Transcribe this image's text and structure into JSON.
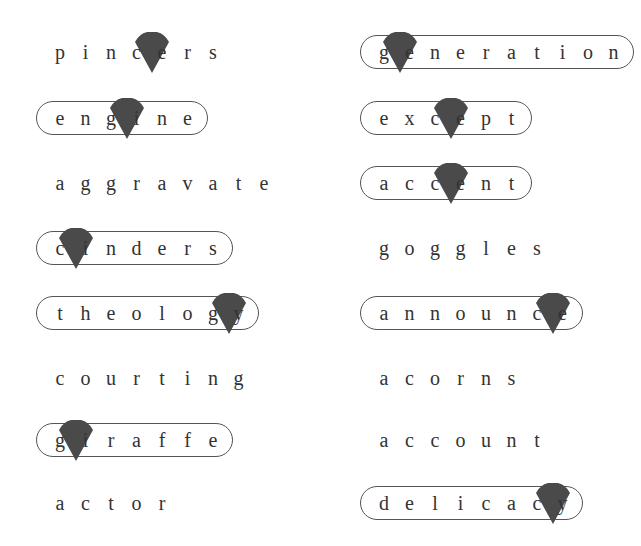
{
  "colors": {
    "text": "#333333",
    "pill_border": "#555555",
    "pointer": "#4a4a4a"
  },
  "letter_spacing_px": 25.5,
  "words": [
    {
      "id": "pincers",
      "text": "pincers",
      "circled": false,
      "pointer_index": 4,
      "column": "left",
      "x": 38,
      "y": 34
    },
    {
      "id": "generation",
      "text": "generation",
      "circled": true,
      "pointer_index": 1,
      "column": "right",
      "x": 362,
      "y": 34
    },
    {
      "id": "engine",
      "text": "engine",
      "circled": true,
      "pointer_index": 3,
      "column": "left",
      "x": 38,
      "y": 100
    },
    {
      "id": "except",
      "text": "except",
      "circled": true,
      "pointer_index": 3,
      "column": "right",
      "x": 362,
      "y": 100
    },
    {
      "id": "aggravate",
      "text": "aggravate",
      "circled": false,
      "pointer_index": null,
      "column": "left",
      "x": 38,
      "y": 165
    },
    {
      "id": "accent",
      "text": "accent",
      "circled": true,
      "pointer_index": 3,
      "column": "right",
      "x": 362,
      "y": 165
    },
    {
      "id": "cinders",
      "text": "cinders",
      "circled": true,
      "pointer_index": 1,
      "column": "left",
      "x": 38,
      "y": 230
    },
    {
      "id": "goggles",
      "text": "goggles",
      "circled": false,
      "pointer_index": null,
      "column": "right",
      "x": 362,
      "y": 230
    },
    {
      "id": "theology",
      "text": "theology",
      "circled": true,
      "pointer_index": 7,
      "column": "left",
      "x": 38,
      "y": 295
    },
    {
      "id": "announce",
      "text": "announce",
      "circled": true,
      "pointer_index": 7,
      "column": "right",
      "x": 362,
      "y": 295
    },
    {
      "id": "courting",
      "text": "courting",
      "circled": false,
      "pointer_index": null,
      "column": "left",
      "x": 38,
      "y": 360
    },
    {
      "id": "acorns",
      "text": "acorns",
      "circled": false,
      "pointer_index": null,
      "column": "right",
      "x": 362,
      "y": 360
    },
    {
      "id": "giraffe",
      "text": "giraffe",
      "circled": true,
      "pointer_index": 1,
      "column": "left",
      "x": 38,
      "y": 422
    },
    {
      "id": "account",
      "text": "account",
      "circled": false,
      "pointer_index": null,
      "column": "right",
      "x": 362,
      "y": 422
    },
    {
      "id": "actor",
      "text": "actor",
      "circled": false,
      "pointer_index": null,
      "column": "left",
      "x": 38,
      "y": 485
    },
    {
      "id": "delicacy",
      "text": "delicacy",
      "circled": true,
      "pointer_index": 7,
      "column": "right",
      "x": 362,
      "y": 485
    }
  ]
}
